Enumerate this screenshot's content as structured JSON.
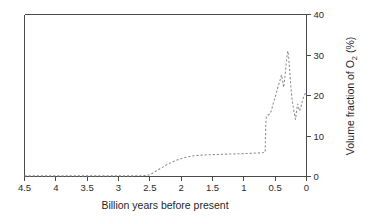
{
  "figure": {
    "background_color": "#ffffff",
    "frame_color": "#4a4a4a",
    "line_color": "#8c8c8c",
    "line_style": "dashed"
  },
  "chart_data": {
    "type": "line",
    "title": "",
    "xlabel": "Billion  years before present",
    "ylabel": "Volume fraction of O2 (%)",
    "ylabel_parts": {
      "pre": "Volume fraction of O",
      "sub": "2",
      "post": " (%)"
    },
    "xlim": [
      4.5,
      0
    ],
    "ylim": [
      0,
      40
    ],
    "x_reversed": true,
    "y_axis_position": "right",
    "grid": false,
    "legend": null,
    "xticks": [
      4.5,
      4,
      3.5,
      3,
      2.5,
      2,
      1.5,
      1,
      0.5,
      0
    ],
    "xtick_labels": [
      "4.5",
      "4",
      "3.5",
      "3",
      "2.5",
      "2",
      "1.5",
      "1",
      "0.5",
      "0"
    ],
    "yticks": [
      0,
      10,
      20,
      30,
      40
    ],
    "ytick_labels": [
      "0",
      "10",
      "20",
      "30",
      "40"
    ],
    "series": [
      {
        "name": "Atmospheric O2",
        "x": [
          4.5,
          4.2,
          3.9,
          3.6,
          3.3,
          3.0,
          2.8,
          2.65,
          2.55,
          2.5,
          2.45,
          2.4,
          2.34,
          2.28,
          2.22,
          2.16,
          2.1,
          2.04,
          1.98,
          1.92,
          1.86,
          1.8,
          1.74,
          1.68,
          1.6,
          1.5,
          1.4,
          1.3,
          1.2,
          1.1,
          1.0,
          0.92,
          0.84,
          0.78,
          0.72,
          0.68,
          0.66,
          0.655,
          0.65,
          0.64,
          0.62,
          0.6,
          0.58,
          0.56,
          0.545,
          0.53,
          0.515,
          0.5,
          0.485,
          0.47,
          0.455,
          0.44,
          0.425,
          0.412,
          0.4,
          0.39,
          0.38,
          0.372,
          0.365,
          0.358,
          0.35,
          0.342,
          0.335,
          0.328,
          0.32,
          0.312,
          0.305,
          0.298,
          0.29,
          0.282,
          0.275,
          0.268,
          0.26,
          0.252,
          0.245,
          0.238,
          0.23,
          0.222,
          0.215,
          0.208,
          0.2,
          0.192,
          0.185,
          0.178,
          0.17,
          0.162,
          0.155,
          0.148,
          0.14,
          0.13,
          0.12,
          0.11,
          0.095,
          0.08,
          0.065,
          0.05,
          0.035,
          0.02,
          0.0
        ],
        "y": [
          0.15,
          0.15,
          0.15,
          0.15,
          0.15,
          0.15,
          0.15,
          0.18,
          0.25,
          0.45,
          0.85,
          1.35,
          1.9,
          2.45,
          3.0,
          3.45,
          3.85,
          4.2,
          4.5,
          4.75,
          4.95,
          5.1,
          5.2,
          5.28,
          5.35,
          5.4,
          5.45,
          5.5,
          5.55,
          5.6,
          5.65,
          5.7,
          5.75,
          5.8,
          5.85,
          5.9,
          5.95,
          9.5,
          13.0,
          14.8,
          15.1,
          15.3,
          15.6,
          16.3,
          17.2,
          18.1,
          18.8,
          19.6,
          20.4,
          21.3,
          22.2,
          22.9,
          23.6,
          24.3,
          25.1,
          24.4,
          23.5,
          22.6,
          22.0,
          22.8,
          23.8,
          24.9,
          26.0,
          27.2,
          28.4,
          29.5,
          30.4,
          31.0,
          30.2,
          29.0,
          27.5,
          26.0,
          24.4,
          22.8,
          21.4,
          20.2,
          19.2,
          18.3,
          17.5,
          16.8,
          16.1,
          15.4,
          14.7,
          14.1,
          14.6,
          15.6,
          16.6,
          17.4,
          17.9,
          17.3,
          16.6,
          16.2,
          16.9,
          17.8,
          18.6,
          19.4,
          20.0,
          20.5,
          20.9
        ]
      }
    ]
  }
}
